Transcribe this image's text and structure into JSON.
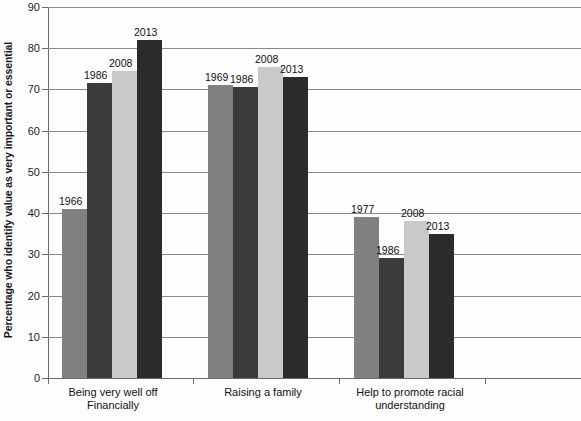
{
  "chart_data": {
    "type": "bar",
    "title": "",
    "subtitle": "",
    "xlabel": "",
    "ylabel": "Percentage who identify value as very important or essential",
    "ylim": [
      0,
      90
    ],
    "ytick_step": 10,
    "yticks": [
      0,
      10,
      20,
      30,
      40,
      50,
      60,
      70,
      80,
      90
    ],
    "grid": true,
    "legend": "none",
    "legend_position": "none",
    "annotations": "Each bar is labeled above with its survey year",
    "categories": [
      "Being very well off Financially",
      "Raising a family",
      "Help to promote racial understanding"
    ],
    "category_lines": [
      [
        "Being very well off",
        "Financially"
      ],
      [
        "Raising a family"
      ],
      [
        "Help to promote racial",
        "understanding"
      ]
    ],
    "series": [
      {
        "name": "First survey year",
        "color": "#808080",
        "labels": [
          "1966",
          "1969",
          "1977"
        ],
        "values": [
          41,
          71,
          39
        ]
      },
      {
        "name": "1986",
        "color": "#3b3b3b",
        "labels": [
          "1986",
          "1986",
          "1986"
        ],
        "values": [
          71.5,
          70.5,
          29
        ]
      },
      {
        "name": "2008",
        "color": "#c9c9c9",
        "labels": [
          "2008",
          "2008",
          "2008"
        ],
        "values": [
          74.5,
          75.5,
          38
        ]
      },
      {
        "name": "2013",
        "color": "#2b2b2b",
        "labels": [
          "2013",
          "2013",
          "2013"
        ],
        "values": [
          82,
          73,
          35
        ]
      }
    ]
  },
  "axis": {
    "y_title": "Percentage who identify value as very important or essential",
    "tick_0": "0",
    "tick_10": "10",
    "tick_20": "20",
    "tick_30": "30",
    "tick_40": "40",
    "tick_50": "50",
    "tick_60": "60",
    "tick_70": "70",
    "tick_80": "80",
    "tick_90": "90"
  },
  "categories": {
    "c0_line0": "Being very well off",
    "c0_line1": "Financially",
    "c1_line0": "Raising a family",
    "c2_line0": "Help to promote racial",
    "c2_line1": "understanding"
  },
  "bar_labels": {
    "g0_s0": "1966",
    "g0_s1": "1986",
    "g0_s2": "2008",
    "g0_s3": "2013",
    "g1_s0": "1969",
    "g1_s1": "1986",
    "g1_s2": "2008",
    "g1_s3": "2013",
    "g2_s0": "1977",
    "g2_s1": "1986",
    "g2_s2": "2008",
    "g2_s3": "2013"
  },
  "colors": {
    "series_1": "#808080",
    "series_2": "#3b3b3b",
    "series_3": "#c9c9c9",
    "series_4": "#2b2b2b",
    "axis": "#6b6b6b",
    "grid": "#8a8a8a",
    "background": "#fdfdfd"
  }
}
